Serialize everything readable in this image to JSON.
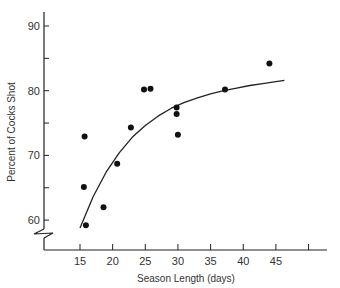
{
  "chart_data": {
    "type": "scatter",
    "title": "",
    "xlabel": "Season Length (days)",
    "ylabel": "Percent of Cocks Shot",
    "x_ticks": [
      15,
      20,
      25,
      30,
      35,
      40,
      45,
      50
    ],
    "x_tick_labels": [
      "15",
      "20",
      "25",
      "30",
      "35",
      "40",
      "45",
      ""
    ],
    "y_ticks": [
      60,
      65,
      70,
      75,
      80,
      85,
      90
    ],
    "y_tick_labels": [
      "60",
      "",
      "70",
      "",
      "80",
      "",
      "90"
    ],
    "xlim": [
      10,
      52
    ],
    "ylim": [
      55,
      92
    ],
    "y_axis_break": true,
    "grid": false,
    "legend": null,
    "series": [
      {
        "name": "observations",
        "kind": "points",
        "x": [
          15.7,
          15.6,
          15.9,
          18.6,
          20.7,
          22.8,
          24.8,
          25.8,
          29.8,
          29.8,
          30.0,
          37.2,
          44.0
        ],
        "y": [
          72.9,
          65.1,
          59.2,
          62.0,
          68.7,
          74.3,
          80.2,
          80.3,
          77.4,
          76.4,
          73.2,
          80.2,
          84.2
        ]
      },
      {
        "name": "fitted curve",
        "kind": "line",
        "x": [
          15,
          17,
          19,
          21,
          23,
          25,
          27,
          29,
          31,
          33,
          35,
          37,
          39,
          41,
          43,
          45,
          46.3
        ],
        "y": [
          58.8,
          63.6,
          67.4,
          70.4,
          72.8,
          74.6,
          76.1,
          77.3,
          78.2,
          78.9,
          79.5,
          80.0,
          80.4,
          80.8,
          81.1,
          81.4,
          81.6
        ]
      }
    ]
  }
}
